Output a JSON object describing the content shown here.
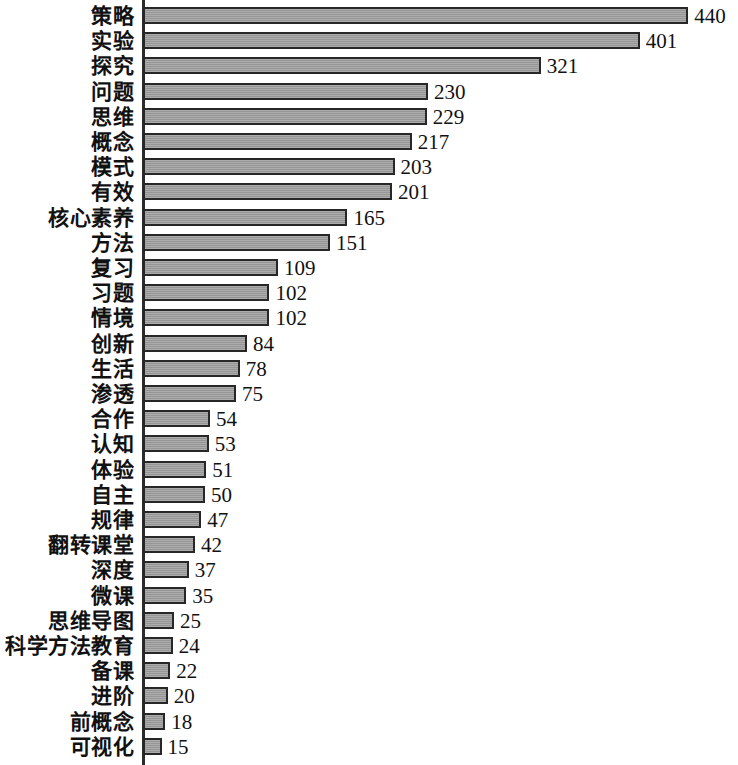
{
  "chart_data": {
    "type": "bar",
    "orientation": "horizontal",
    "title": "",
    "subtitle": "",
    "xlabel": "",
    "ylabel": "",
    "xlim": [
      0,
      440
    ],
    "grid": false,
    "legend": null,
    "bar_color": "#9e9e9e",
    "bar_border_color": "#272727",
    "background_color": "#ffffff",
    "text_color": "#111111",
    "value_labels_shown": true,
    "categories": [
      "策略",
      "实验",
      "探究",
      "问题",
      "思维",
      "概念",
      "模式",
      "有效",
      "核心素养",
      "方法",
      "复习",
      "习题",
      "情境",
      "创新",
      "生活",
      "渗透",
      "合作",
      "认知",
      "体验",
      "自主",
      "规律",
      "翻转课堂",
      "深度",
      "微课",
      "思维导图",
      "科学方法教育",
      "备课",
      "进阶",
      "前概念",
      "可视化"
    ],
    "values": [
      440,
      401,
      321,
      230,
      229,
      217,
      203,
      201,
      165,
      151,
      109,
      102,
      102,
      84,
      78,
      75,
      54,
      53,
      51,
      50,
      47,
      42,
      37,
      35,
      25,
      24,
      22,
      20,
      18,
      15
    ]
  }
}
